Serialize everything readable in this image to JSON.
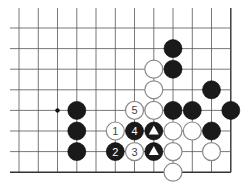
{
  "diagram": {
    "grid": {
      "x": [
        19,
        38.3,
        57.5,
        76.8,
        96,
        115.3,
        134.5,
        153.8,
        173,
        192.3,
        211.5,
        230.8
      ],
      "y": [
        28,
        48.6,
        69.2,
        89.8,
        110.4,
        131,
        151.6,
        172.2
      ],
      "line_top": 8,
      "line_left": 10,
      "right_edge_col": 11,
      "bottom_edge_row": 7,
      "line_color": "#555555",
      "edge_color": "#333333"
    },
    "star_points": [
      {
        "col": 2,
        "row": 4
      }
    ],
    "stones": [
      {
        "col": 8,
        "row": 1,
        "color": "black",
        "label": ""
      },
      {
        "col": 8,
        "row": 2,
        "color": "black",
        "label": ""
      },
      {
        "col": 7,
        "row": 2,
        "color": "white",
        "label": ""
      },
      {
        "col": 7,
        "row": 3,
        "color": "white",
        "label": ""
      },
      {
        "col": 10,
        "row": 3,
        "color": "black",
        "label": ""
      },
      {
        "col": 3,
        "row": 4,
        "color": "black",
        "label": ""
      },
      {
        "col": 6,
        "row": 4,
        "color": "white",
        "label": "5"
      },
      {
        "col": 7,
        "row": 4,
        "color": "white",
        "label": ""
      },
      {
        "col": 8,
        "row": 4,
        "color": "black",
        "label": ""
      },
      {
        "col": 9,
        "row": 4,
        "color": "black",
        "label": ""
      },
      {
        "col": 11,
        "row": 4,
        "color": "black",
        "label": ""
      },
      {
        "col": 3,
        "row": 5,
        "color": "black",
        "label": ""
      },
      {
        "col": 5,
        "row": 5,
        "color": "white",
        "label": "1"
      },
      {
        "col": 6,
        "row": 5,
        "color": "black",
        "label": "4"
      },
      {
        "col": 7,
        "row": 5,
        "color": "black",
        "label": "",
        "mark": "triangle"
      },
      {
        "col": 8,
        "row": 5,
        "color": "white",
        "label": ""
      },
      {
        "col": 9,
        "row": 5,
        "color": "white",
        "label": ""
      },
      {
        "col": 10,
        "row": 5,
        "color": "black",
        "label": ""
      },
      {
        "col": 3,
        "row": 6,
        "color": "black",
        "label": ""
      },
      {
        "col": 5,
        "row": 6,
        "color": "black",
        "label": "2"
      },
      {
        "col": 6,
        "row": 6,
        "color": "white",
        "label": "3"
      },
      {
        "col": 7,
        "row": 6,
        "color": "black",
        "label": "",
        "mark": "triangle"
      },
      {
        "col": 8,
        "row": 6,
        "color": "white",
        "label": ""
      },
      {
        "col": 10,
        "row": 6,
        "color": "white",
        "label": ""
      },
      {
        "col": 8,
        "row": 7,
        "color": "white",
        "label": ""
      }
    ],
    "colors": {
      "black_stone": "#1a1a1a",
      "white_stone": "#ffffff",
      "white_stroke": "#8a8a8a",
      "black_label": "#ffffff",
      "white_label": "#444444"
    },
    "stone_radius": 9
  }
}
